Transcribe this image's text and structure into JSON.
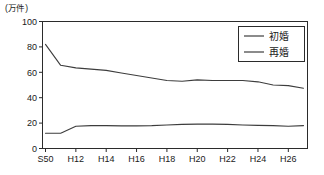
{
  "chart_data": {
    "type": "line",
    "title": "",
    "subtitle": "",
    "unit_label": "(万件)",
    "xlabel": "",
    "ylabel": "",
    "ylim": [
      0,
      100
    ],
    "yticks": [
      0,
      20,
      40,
      60,
      80,
      100
    ],
    "ytick_labels": [
      "0",
      "20",
      "40",
      "60",
      "80",
      "100"
    ],
    "grid": false,
    "legend_position": "top-right",
    "x": [
      "S50",
      "H7",
      "H12",
      "H13",
      "H14",
      "H15",
      "H16",
      "H17",
      "H18",
      "H19",
      "H20",
      "H21",
      "H22",
      "H23",
      "H24",
      "H25",
      "H26",
      "H27"
    ],
    "xtick_labels": [
      "S50",
      "H12",
      "H14",
      "H16",
      "H18",
      "H20",
      "H22",
      "H24",
      "H26"
    ],
    "series": [
      {
        "name": "初婚",
        "color": "#3d3d3d",
        "values": [
          82,
          65.5,
          63.5,
          62.5,
          61.5,
          59.5,
          57.5,
          55.5,
          53.5,
          53,
          54,
          53.5,
          53.5,
          53.5,
          52.5,
          50,
          49.5,
          47.5
        ]
      },
      {
        "name": "再婚",
        "color": "#3d3d3d",
        "values": [
          12,
          12,
          17.5,
          18,
          18,
          17.8,
          17.8,
          18,
          18.5,
          19,
          19.2,
          19.2,
          19,
          18.5,
          18.2,
          18,
          17.5,
          18
        ]
      }
    ]
  },
  "legend": {
    "items": [
      {
        "label": "初婚"
      },
      {
        "label": "再婚"
      }
    ]
  },
  "axes": {
    "y_unit": "(万件)"
  }
}
